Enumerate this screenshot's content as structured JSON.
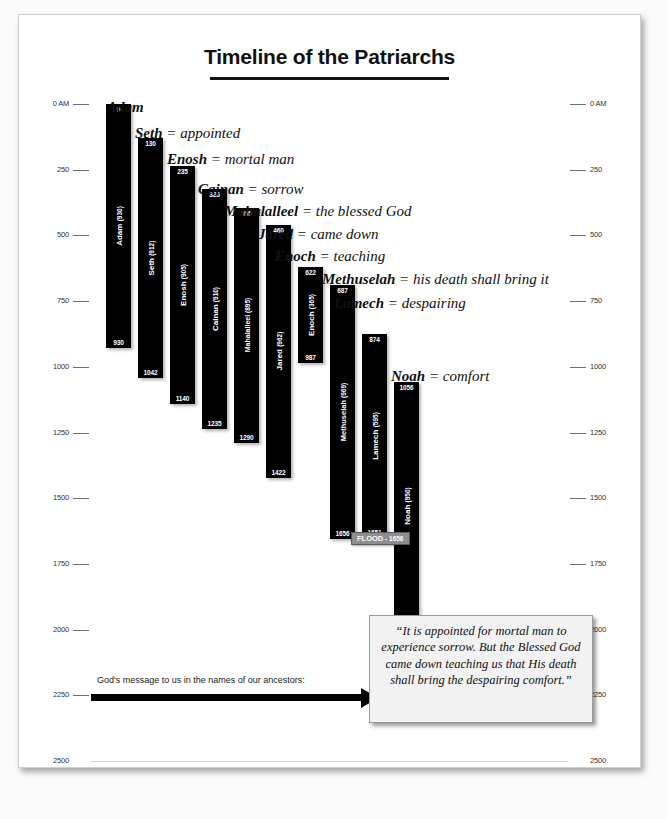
{
  "title": "Timeline of the Patriarchs",
  "axis": {
    "top_label": "0 AM",
    "ticks": [
      "0 AM",
      "250",
      "500",
      "750",
      "1000",
      "1250",
      "1500",
      "1750",
      "2000",
      "2250",
      "2500"
    ],
    "tick_values": [
      0,
      250,
      500,
      750,
      1000,
      1250,
      1500,
      1750,
      2000,
      2250,
      2500
    ]
  },
  "arrow": {
    "label": "God's message to us in the names of our ancestors:"
  },
  "quote": {
    "text": "“It is appointed for mortal man to experience sorrow.  But the Blessed God came down teaching us that His death shall bring the despairing comfort.”"
  },
  "flood": {
    "label": "FLOOD",
    "separator": "-",
    "year": "1656"
  },
  "chart_data": {
    "type": "bar",
    "title": "Timeline of the Patriarchs",
    "xlabel": "",
    "ylabel": "Year (Anno Mundi)",
    "ylim": [
      0,
      2500
    ],
    "orientation": "vertical-timeline",
    "grid": true,
    "legend": "none",
    "axis_unit": "AM",
    "categories": [
      "Adam",
      "Seth",
      "Enosh",
      "Cainan",
      "Mahalalleel",
      "Jared",
      "Enoch",
      "Methuselah",
      "Lamech",
      "Noah"
    ],
    "series": [
      {
        "name": "birth_year",
        "values": [
          0,
          130,
          235,
          325,
          395,
          460,
          622,
          687,
          874,
          1056
        ]
      },
      {
        "name": "death_year",
        "values": [
          930,
          1042,
          1140,
          1235,
          1290,
          1422,
          987,
          1656,
          1651,
          2006
        ]
      },
      {
        "name": "lifespan",
        "values": [
          930,
          912,
          905,
          910,
          895,
          962,
          365,
          969,
          595,
          950
        ]
      }
    ],
    "patriarchs": [
      {
        "name": "Adam",
        "meaning": "",
        "birth": "0",
        "death": "930",
        "lifespan": "930",
        "bar_label": "Adam (930)",
        "callout": "Adam"
      },
      {
        "name": "Seth",
        "meaning": "appointed",
        "birth": "130",
        "death": "1042",
        "lifespan": "912",
        "bar_label": "Seth (912)",
        "callout": "Seth = appointed"
      },
      {
        "name": "Enosh",
        "meaning": "mortal man",
        "birth": "235",
        "death": "1140",
        "lifespan": "905",
        "bar_label": "Enosh (905)",
        "callout": "Enosh = mortal man"
      },
      {
        "name": "Cainan",
        "meaning": "sorrow",
        "birth": "325",
        "death": "1235",
        "lifespan": "910",
        "bar_label": "Cainan (910)",
        "callout": "Cainan = sorrow"
      },
      {
        "name": "Mahalalleel",
        "meaning": "the blessed God",
        "birth": "395",
        "death": "1290",
        "lifespan": "895",
        "bar_label": "Mahalalleel (895)",
        "callout": "Mahalalleel = the blessed God"
      },
      {
        "name": "Jared",
        "meaning": "came down",
        "birth": "460",
        "death": "1422",
        "lifespan": "962",
        "bar_label": "Jared (962)",
        "callout": "Jared = came down"
      },
      {
        "name": "Enoch",
        "meaning": "teaching",
        "birth": "622",
        "death": "987",
        "lifespan": "365",
        "bar_label": "Enoch (365)",
        "callout": "Enoch = teaching"
      },
      {
        "name": "Methuselah",
        "meaning": "his death shall bring it",
        "birth": "687",
        "death": "1656",
        "lifespan": "969",
        "bar_label": "Methuselah (969)",
        "callout": "Methuselah = his death shall bring it"
      },
      {
        "name": "Lamech",
        "meaning": "despairing",
        "birth": "874",
        "death": "1651",
        "lifespan": "595",
        "bar_label": "Lamech (595)",
        "callout": "Lamech = despairing"
      },
      {
        "name": "Noah",
        "meaning": "comfort",
        "birth": "1056",
        "death": "2006",
        "lifespan": "950",
        "bar_label": "Noah (950)",
        "callout": "Noah = comfort"
      }
    ],
    "event_markers": [
      {
        "label": "FLOOD",
        "year": 1656,
        "display": "FLOOD - 1656"
      }
    ]
  },
  "bars_meta": [
    {
      "key": "adam",
      "left": 87,
      "width": 25,
      "name_size": 8
    },
    {
      "key": "seth",
      "left": 119,
      "width": 25,
      "name_size": 8
    },
    {
      "key": "enosh",
      "left": 151,
      "width": 25,
      "name_size": 8
    },
    {
      "key": "cainan",
      "left": 183,
      "width": 25,
      "name_size": 8
    },
    {
      "key": "mahalalleel",
      "left": 215,
      "width": 25,
      "name_size": 7
    },
    {
      "key": "jared",
      "left": 247,
      "width": 25,
      "name_size": 8
    },
    {
      "key": "enoch",
      "left": 279,
      "width": 25,
      "name_size": 8
    },
    {
      "key": "methuselah",
      "left": 311,
      "width": 25,
      "name_size": 7.5
    },
    {
      "key": "lamech",
      "left": 343,
      "width": 25,
      "name_size": 8
    },
    {
      "key": "noah",
      "left": 375,
      "width": 25,
      "name_size": 8
    }
  ],
  "callouts_meta": [
    {
      "left": 88,
      "top": 84
    },
    {
      "left": 116,
      "top": 110
    },
    {
      "left": 148,
      "top": 136
    },
    {
      "left": 179,
      "top": 166
    },
    {
      "left": 205,
      "top": 188
    },
    {
      "left": 239,
      "top": 211
    },
    {
      "left": 256,
      "top": 233
    },
    {
      "left": 303,
      "top": 256
    },
    {
      "left": 315,
      "top": 280
    },
    {
      "left": 372,
      "top": 353
    }
  ]
}
